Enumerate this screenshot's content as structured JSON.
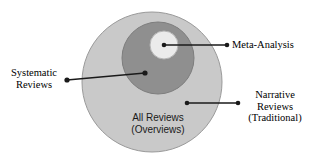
{
  "diagram": {
    "type": "nested-venn",
    "colors": {
      "outer_fill": "#c9c9c9",
      "middle_fill": "#8f8f8f",
      "inner_fill": "#ebebeb",
      "stroke": "#8a8a8a",
      "line": "#1a1a1a",
      "text": "#000000",
      "background": "#ffffff"
    },
    "circles": [
      {
        "name": "all-reviews",
        "label": "All Reviews (Overviews)",
        "cx": 152,
        "cy": 82,
        "r": 70,
        "fill": "#c9c9c9"
      },
      {
        "name": "systematic-reviews",
        "label": "Systematic Reviews",
        "cx": 158,
        "cy": 58,
        "r": 36,
        "fill": "#8f8f8f"
      },
      {
        "name": "meta-analysis",
        "label": "Meta-Analysis",
        "cx": 164,
        "cy": 45,
        "r": 14,
        "fill": "#ebebeb"
      }
    ],
    "connectors": [
      {
        "name": "meta-analysis",
        "x1": 164,
        "y1": 45,
        "x2": 227,
        "y2": 45
      },
      {
        "name": "systematic-reviews",
        "x1": 145,
        "y1": 73,
        "x2": 67,
        "y2": 80
      },
      {
        "name": "narrative-reviews",
        "x1": 187,
        "y1": 103,
        "x2": 238,
        "y2": 103
      }
    ],
    "labels": {
      "meta_analysis": {
        "line1": "Meta-Analysis"
      },
      "systematic_reviews": {
        "line1": "Systematic",
        "line2": "Reviews"
      },
      "narrative_reviews": {
        "line1": "Narrative",
        "line2": "Reviews",
        "line3": "(Traditional)"
      },
      "all_reviews": {
        "line1": "All Reviews",
        "line2": "(Overviews)"
      }
    }
  }
}
